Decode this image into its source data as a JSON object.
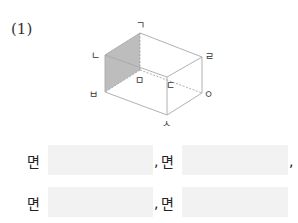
{
  "question": {
    "number": "(1)"
  },
  "figure": {
    "type": "rectangular-prism",
    "shaded_face": "ㄴㅂㅁㄱ",
    "vertices": {
      "g": "ㄱ",
      "n": "ㄴ",
      "d": "ㄷ",
      "r": "ㄹ",
      "m": "ㅁ",
      "b": "ㅂ",
      "s": "ㅅ",
      "o": "ㅇ"
    },
    "colors": {
      "edge": "#aaaaaa",
      "shade": "#bdbdbd",
      "hidden": "#9a9a9a"
    }
  },
  "answers": {
    "face_prefix": "면",
    "separator": ",",
    "rows": [
      {
        "blanks": [
          "",
          ""
        ]
      },
      {
        "blanks": [
          "",
          ""
        ]
      }
    ]
  }
}
